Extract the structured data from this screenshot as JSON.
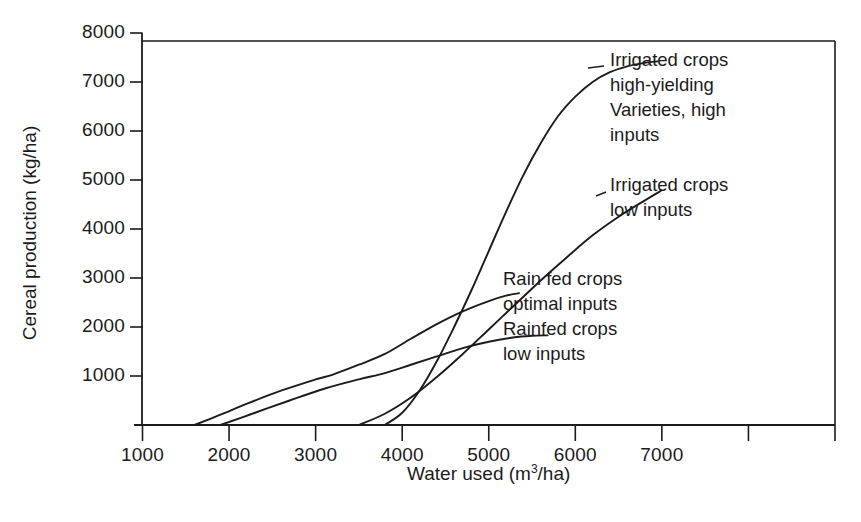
{
  "chart_data": {
    "type": "line",
    "title": "",
    "xlabel": "Water used (m3/ha)",
    "xlabel_base": "Water used (m",
    "xlabel_sup": "3",
    "xlabel_tail": "/ha)",
    "ylabel": "Cereal production (kg/ha)",
    "xlim": [
      1000,
      9000
    ],
    "ylim": [
      0,
      8000
    ],
    "xticks": [
      1000,
      2000,
      3000,
      4000,
      5000,
      6000,
      7000,
      8000,
      9000
    ],
    "xtick_labels": [
      "1000",
      "2000",
      "3000",
      "4000",
      "5000",
      "6000",
      "7000",
      "",
      ""
    ],
    "yticks": [
      0,
      1000,
      2000,
      3000,
      4000,
      5000,
      6000,
      7000,
      8000
    ],
    "ytick_labels": [
      "",
      "1000",
      "2000",
      "3000",
      "4000",
      "5000",
      "6000",
      "7000",
      "8000"
    ],
    "grid": false,
    "legend_position": "inline-annotations",
    "series": [
      {
        "name": "Irrigated crops high-yielding Varieties, high inputs",
        "label_lines": [
          "Irrigated crops",
          "high-yielding",
          "Varieties, high",
          "inputs"
        ],
        "x": [
          3800,
          4000,
          4200,
          4400,
          4600,
          4800,
          5000,
          5200,
          5400,
          5600,
          5800,
          6000,
          6200,
          6400,
          6600,
          6800,
          6950
        ],
        "y": [
          0,
          250,
          700,
          1300,
          2000,
          2750,
          3550,
          4350,
          5100,
          5750,
          6300,
          6700,
          7000,
          7200,
          7320,
          7390,
          7420
        ]
      },
      {
        "name": "Irrigated crops low inputs",
        "label_lines": [
          "Irrigated crops",
          "low inputs"
        ],
        "x": [
          3500,
          3800,
          4100,
          4400,
          4700,
          5000,
          5300,
          5600,
          5900,
          6200,
          6500,
          6800,
          7000
        ],
        "y": [
          0,
          230,
          560,
          980,
          1450,
          1950,
          2450,
          2950,
          3420,
          3870,
          4250,
          4580,
          4790
        ]
      },
      {
        "name": "Rain fed crops optimal inputs",
        "label_lines": [
          "Rain fed crops",
          "optimal inputs"
        ],
        "x": [
          1600,
          1900,
          2200,
          2600,
          3000,
          3200,
          3500,
          3800,
          4100,
          4400,
          4700,
          5000,
          5200,
          5350
        ],
        "y": [
          0,
          210,
          430,
          700,
          930,
          1030,
          1230,
          1450,
          1760,
          2060,
          2320,
          2530,
          2640,
          2690
        ]
      },
      {
        "name": "Rainfed crops low inputs",
        "label_lines": [
          "Rainfed crops",
          "low inputs"
        ],
        "x": [
          1900,
          2300,
          2700,
          3100,
          3500,
          3800,
          4100,
          4400,
          4700,
          5000,
          5300,
          5500,
          5680
        ],
        "y": [
          0,
          250,
          500,
          740,
          930,
          1060,
          1230,
          1400,
          1570,
          1700,
          1790,
          1820,
          1830
        ]
      }
    ]
  },
  "axes": {
    "y_title": "Cereal production (kg/ha)",
    "x_title_parts": {
      "before": "Water used (m",
      "sup": "3",
      "after": "/ha)"
    }
  },
  "annotations": {
    "irrigated_high": "Irrigated crops\nhigh-yielding\nVarieties, high\ninputs",
    "irrigated_low": "Irrigated crops\nlow inputs",
    "rainfed_optimal": "Rain fed crops\noptimal inputs",
    "rainfed_low": "Rainfed crops\nlow inputs"
  },
  "colors": {
    "line": "#1b1b1b",
    "axis": "#1b1b1b",
    "background": "#ffffff",
    "text": "#1b1b1b"
  }
}
